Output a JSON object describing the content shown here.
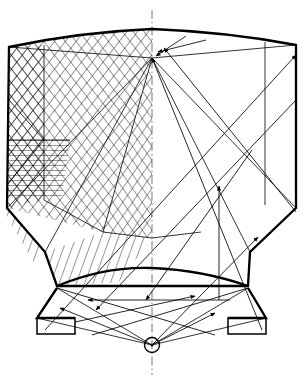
{
  "figure": {
    "kind": "technical line drawing",
    "background_color": "#ffffff",
    "line_color": "#000000",
    "axis_color": "#555555"
  },
  "geometry": {
    "canvas": {
      "width": 305,
      "height": 381
    },
    "axis_of_symmetry_x": 152,
    "source_point": {
      "x": 152,
      "y": 345,
      "radius": 7,
      "label": "light-source"
    },
    "apex_node": {
      "x": 152,
      "y": 58,
      "label": "upper-convergence-node"
    },
    "centre_node": {
      "x": 152,
      "y": 238,
      "label": "lower-convergence-node"
    },
    "top_arc": {
      "left_x": 9,
      "left_y": 47,
      "peak_x": 152,
      "peak_y": 29,
      "right_x": 296,
      "right_y": 45
    },
    "bottom_arc": {
      "left_x": 55,
      "left_y": 286,
      "peak_x": 152,
      "peak_y": 268,
      "right_x": 250,
      "right_y": 286
    },
    "body_left_edge_x": 8,
    "body_right_edge_x": 296,
    "inner_vertical_left_x": 44,
    "inner_vertical_right_x": 265,
    "skirt_bottom_y": 318,
    "foot_plate_y": 334
  },
  "elements": {
    "housing_outline": "housing-outline",
    "skirt_outline": "skirt-outline",
    "left_foot": "left-foot-bracket",
    "right_foot": "right-foot-bracket",
    "centre_axis": "centre-axis-dash-dot",
    "source_marker": "source-circle"
  },
  "hatching": {
    "zones": [
      {
        "name": "upper-left-crosshatch",
        "style": "cross-hatch",
        "spacing": 6,
        "angles": [
          38,
          -38
        ]
      },
      {
        "name": "left-band-horizontal",
        "style": "horizontal-hatch",
        "spacing": 5,
        "angles": [
          0
        ]
      },
      {
        "name": "central-wedge-crosshatch",
        "style": "cross-hatch",
        "spacing": 6,
        "angles": [
          35,
          -35
        ]
      },
      {
        "name": "lower-left-wedge-hatch",
        "style": "single-hatch",
        "spacing": 6,
        "angles": [
          20
        ]
      }
    ]
  },
  "rays": {
    "count": 14,
    "arrowhead_style": "solid filled triangle",
    "arrow_length": 7,
    "description": "Rays emanate from the source point, strike the reflector walls and cross the chamber toward the apex node.",
    "items": [
      {
        "id": "ray-1",
        "from": "source",
        "to": "upper-left-wall",
        "arrow": true
      },
      {
        "id": "ray-2",
        "from": "source",
        "to": "upper-right-wall",
        "arrow": true
      },
      {
        "id": "ray-3",
        "from": "left-wall",
        "to": "apex-node",
        "arrow": true
      },
      {
        "id": "ray-4",
        "from": "right-wall",
        "to": "apex-node",
        "arrow": true
      },
      {
        "id": "ray-5",
        "from": "source",
        "to": "right-skirt-edge",
        "arrow": true
      },
      {
        "id": "ray-6",
        "from": "source",
        "to": "left-skirt-edge",
        "arrow": true
      },
      {
        "id": "ray-7",
        "from": "lower-right",
        "to": "upper-left",
        "arrow": true
      },
      {
        "id": "ray-8",
        "from": "lower-left",
        "to": "upper-right",
        "arrow": true
      }
    ]
  },
  "labels": {
    "visible_text": []
  }
}
